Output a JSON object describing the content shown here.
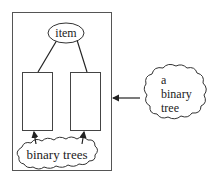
{
  "diagram": {
    "root_node": {
      "label": "item"
    },
    "subtree_boxes": [
      {
        "name": "left-subtree"
      },
      {
        "name": "right-subtree"
      }
    ],
    "bottom_cloud": {
      "label": "binary trees"
    },
    "side_cloud": {
      "lines": [
        "a",
        "binary",
        "tree"
      ]
    },
    "colors": {
      "stroke": "#333333",
      "background": "#ffffff",
      "text": "#222222"
    }
  }
}
